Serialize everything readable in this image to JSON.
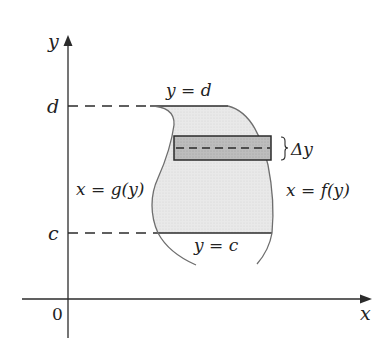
{
  "diagram": {
    "type": "region-between-curves-horizontal-strip",
    "axes": {
      "x_label": "x",
      "y_label": "y",
      "origin_label": "0"
    },
    "levels": {
      "top_tick": "d",
      "bottom_tick": "c"
    },
    "boundary_labels": {
      "top": "y = d",
      "bottom": "y = c",
      "left": "x = g(y)",
      "right": "x = f(y)"
    },
    "strip_label": "Δy",
    "colors": {
      "region_fill": "#e6e6e6",
      "strip_fill": "#b8b8b8",
      "curve_stroke": "#6e6e6e",
      "axis_stroke": "#2b2b2b"
    }
  }
}
